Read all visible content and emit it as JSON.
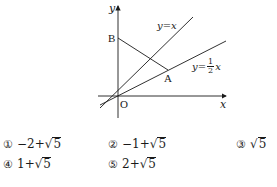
{
  "diagram": {
    "axes": {
      "x_label": "x",
      "y_label": "y",
      "origin_label": "O"
    },
    "points": {
      "A": "A",
      "B": "B"
    },
    "lines": [
      {
        "id": "line-y-equals-x",
        "label_lhs": "y",
        "label_eq": "=",
        "label_rhs": "x"
      },
      {
        "id": "line-y-equals-half-x",
        "label_lhs": "y",
        "label_eq": "=",
        "frac_num": "1",
        "frac_den": "2",
        "label_rhs": "x"
      }
    ],
    "colors": {
      "stroke": "#1a1a1a",
      "background": "#ffffff"
    }
  },
  "choices": [
    {
      "marker": "①",
      "prefix": "−2+",
      "radicand": "5"
    },
    {
      "marker": "②",
      "prefix": "−1+",
      "radicand": "5"
    },
    {
      "marker": "③",
      "prefix": "",
      "radicand": "5"
    },
    {
      "marker": "④",
      "prefix": "1+",
      "radicand": "5"
    },
    {
      "marker": "⑤",
      "prefix": "2+",
      "radicand": "5"
    }
  ]
}
